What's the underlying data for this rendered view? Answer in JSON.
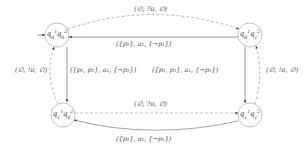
{
  "diagram": {
    "type": "state-machine",
    "nodes": [
      {
        "id": "q0q0",
        "label_html": "q<sub>0</sub><sup>1</sup>q<sub>0</sub><sup>2</sup>",
        "label": "q0^1 q0^2",
        "initial": true,
        "position": "top-left"
      },
      {
        "id": "q0q1",
        "label_html": "q<sub>0</sub><sup>1</sup>q<sub>1</sub><sup>2</sup>",
        "label": "q0^1 q1^2",
        "initial": false,
        "position": "top-right"
      },
      {
        "id": "q1q0",
        "label_html": "q<sub>1</sub><sup>1</sup>q<sub>0</sub><sup>2</sup>",
        "label": "q1^1 q0^2",
        "initial": false,
        "position": "bottom-left"
      },
      {
        "id": "q1q1",
        "label_html": "q<sub>1</sub><sup>1</sup>q<sub>1</sub><sup>2</sup>",
        "label": "q1^1 q1^2",
        "initial": false,
        "position": "bottom-right"
      }
    ],
    "edges": [
      {
        "from": "q0q0",
        "to": "q0q1",
        "label": "(∅, ?π, ∅)",
        "style": "dashed",
        "shape": "curved-top"
      },
      {
        "from": "q0q1",
        "to": "q0q0",
        "label": "({p₂}, a₂, {¬p₁})",
        "style": "solid",
        "shape": "straight"
      },
      {
        "from": "q0q0",
        "to": "q1q0",
        "label": "({p₁, p₂}, a₁, {¬p₂})",
        "style": "solid",
        "shape": "straight"
      },
      {
        "from": "q1q0",
        "to": "q0q0",
        "label": "(∅, !π, ∅)",
        "style": "dashed",
        "shape": "curved-left"
      },
      {
        "from": "q0q1",
        "to": "q1q1",
        "label": "({p₁, p₂}, a₁, {¬p₂})",
        "style": "solid",
        "shape": "straight"
      },
      {
        "from": "q1q1",
        "to": "q0q1",
        "label": "(∅, !π, ∅)",
        "style": "dashed",
        "shape": "curved-right"
      },
      {
        "from": "q1q0",
        "to": "q1q1",
        "label": "(∅, ?π, ∅)",
        "style": "dashed",
        "shape": "straight"
      },
      {
        "from": "q1q1",
        "to": "q1q0",
        "label": "({p₂}, a₂, {¬p₁})",
        "style": "solid",
        "shape": "curved-bottom"
      }
    ]
  },
  "labels": {
    "top_arc": "(∅, ?π, ∅)",
    "top_line": "({p₂}, a₂, {¬p₁})",
    "left_line": "({p₁, p₂}, a₁, {¬p₂})",
    "right_line": "({p₁, p₂}, a₁, {¬p₂})",
    "left_dashed": "(∅, !π, ∅)",
    "right_dashed": "(∅, !π, ∅)",
    "bottom_line": "(∅, ?π, ∅)",
    "bottom_arc": "({p₂}, a₂, {¬p₁})"
  },
  "colors": {
    "stroke": "#555555",
    "dashed_stroke": "#777777",
    "text": "#444444"
  }
}
